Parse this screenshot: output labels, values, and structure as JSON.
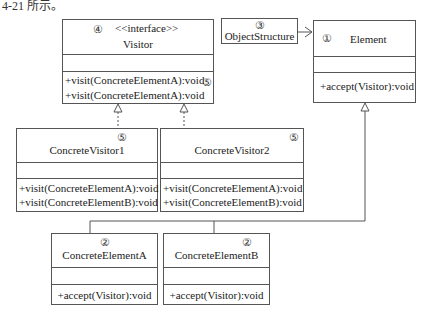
{
  "caption": "4-21 所示。",
  "classes": {
    "visitor": {
      "marker": "④",
      "stereotype": "<<interface>>",
      "name": "Visitor",
      "methods": [
        "+visit(ConcreteElementA):void",
        "+visit(ConcreteElementA):void"
      ],
      "method_marker": "⑤"
    },
    "object_structure": {
      "marker": "③",
      "name": "ObjectStructure"
    },
    "element": {
      "marker": "①",
      "name": "Element",
      "methods": [
        "+accept(Visitor):void"
      ]
    },
    "concrete_visitor1": {
      "marker": "⑤",
      "name": "ConcreteVisitor1",
      "methods": [
        "+visit(ConcreteElementA):void",
        "+visit(ConcreteElementB):void"
      ]
    },
    "concrete_visitor2": {
      "marker": "⑤",
      "name": "ConcreteVisitor2",
      "methods": [
        "+visit(ConcreteElementA):void",
        "+visit(ConcreteElementB):void"
      ]
    },
    "concrete_element_a": {
      "marker": "②",
      "name": "ConcreteElementA",
      "methods": [
        "+accept(Visitor):void"
      ]
    },
    "concrete_element_b": {
      "marker": "②",
      "name": "ConcreteElementB",
      "methods": [
        "+accept(Visitor):void"
      ]
    }
  },
  "relations": [
    {
      "from": "ObjectStructure",
      "to": "Element",
      "type": "association"
    },
    {
      "from": "ConcreteVisitor1",
      "to": "Visitor",
      "type": "realization"
    },
    {
      "from": "ConcreteVisitor2",
      "to": "Visitor",
      "type": "realization"
    },
    {
      "from": "ConcreteElementA",
      "to": "Element",
      "type": "generalization"
    },
    {
      "from": "ConcreteElementB",
      "to": "Element",
      "type": "generalization"
    }
  ]
}
